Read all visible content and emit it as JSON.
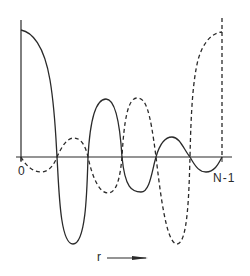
{
  "figure": {
    "title": "",
    "labels": {
      "origin": "0",
      "end": "N-1",
      "axis": "r"
    },
    "colors": {
      "ink": "#2a2a2a",
      "background": "#ffffff"
    },
    "series": [
      {
        "name": "solid-curve",
        "style": "solid",
        "description": "Starts at maximum at r=0, oscillates with 6 zero crossings, ending near zero at N-1"
      },
      {
        "name": "dashed-curve",
        "style": "dashed",
        "description": "Starts at zero at r=0, oscillates, rising to maximum at N-1"
      }
    ]
  }
}
